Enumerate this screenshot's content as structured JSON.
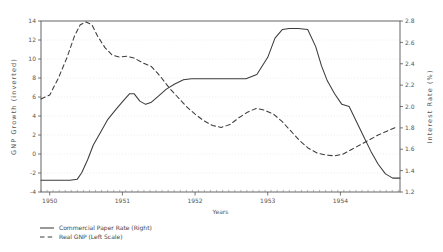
{
  "chart_data": {
    "type": "line",
    "title": "",
    "xlabel": "Years",
    "ylabel": "GNP Growth (inverted)",
    "y2label": "Interest Rate (%)",
    "xlim": [
      1949.88,
      1954.82
    ],
    "xticks": [
      1950,
      1951,
      1952,
      1953,
      1954
    ],
    "xticklabels": [
      "1950",
      "1951",
      "1952",
      "1953",
      "1954"
    ],
    "ylim": [
      14,
      -4
    ],
    "yticks": [
      -4,
      -2,
      0,
      2,
      4,
      6,
      8,
      10,
      12,
      14
    ],
    "yticklabels": [
      "-4",
      "-2",
      "0",
      "2",
      "4",
      "6",
      "8",
      "10",
      "12",
      "14"
    ],
    "y2lim": [
      1.2,
      2.8
    ],
    "y2ticks": [
      1.2,
      1.4,
      1.6,
      1.8,
      2.0,
      2.2,
      2.4,
      2.6,
      2.8
    ],
    "y2ticklabels": [
      "1.2",
      "1.4",
      "1.6",
      "1.8",
      "2.0",
      "2.2",
      "2.4",
      "2.6",
      "2.8"
    ],
    "grid": true,
    "grid_color": "#cccccc",
    "legend_position": "below-left",
    "line_color": "#3c3c3c",
    "series": [
      {
        "name": "Commercial Paper Rate (Right)",
        "axis": "right",
        "style": "solid",
        "x": [
          1949.88,
          1950.0,
          1950.15,
          1950.28,
          1950.38,
          1950.44,
          1950.52,
          1950.6,
          1950.7,
          1950.8,
          1950.92,
          1951.02,
          1951.1,
          1951.16,
          1951.24,
          1951.32,
          1951.4,
          1951.5,
          1951.6,
          1951.72,
          1951.84,
          1951.95,
          1952.05,
          1952.16,
          1952.28,
          1952.4,
          1952.55,
          1952.7,
          1952.85,
          1953.0,
          1953.1,
          1953.2,
          1953.3,
          1953.42,
          1953.55,
          1953.66,
          1953.74,
          1953.82,
          1953.92,
          1954.02,
          1954.12,
          1954.22,
          1954.32,
          1954.42,
          1954.52,
          1954.62,
          1954.72,
          1954.82
        ],
        "y": [
          1.31,
          1.31,
          1.31,
          1.31,
          1.32,
          1.38,
          1.5,
          1.64,
          1.76,
          1.88,
          1.98,
          2.06,
          2.12,
          2.12,
          2.05,
          2.02,
          2.04,
          2.1,
          2.16,
          2.21,
          2.25,
          2.26,
          2.26,
          2.26,
          2.26,
          2.26,
          2.26,
          2.26,
          2.3,
          2.46,
          2.64,
          2.72,
          2.73,
          2.73,
          2.72,
          2.56,
          2.38,
          2.24,
          2.12,
          2.02,
          2.0,
          1.86,
          1.72,
          1.58,
          1.46,
          1.37,
          1.33,
          1.33
        ]
      },
      {
        "name": "Real GNP (Left Scale)",
        "axis": "left",
        "style": "dashed",
        "x": [
          1949.88,
          1950.0,
          1950.12,
          1950.24,
          1950.34,
          1950.42,
          1950.5,
          1950.58,
          1950.66,
          1950.76,
          1950.86,
          1950.96,
          1951.06,
          1951.16,
          1951.28,
          1951.4,
          1951.52,
          1951.64,
          1951.76,
          1951.88,
          1952.0,
          1952.12,
          1952.24,
          1952.36,
          1952.48,
          1952.6,
          1952.72,
          1952.84,
          1952.96,
          1953.08,
          1953.2,
          1953.32,
          1953.44,
          1953.56,
          1953.68,
          1953.8,
          1953.92,
          1954.04,
          1954.16,
          1954.28,
          1954.4,
          1954.52,
          1954.64,
          1954.76
        ],
        "y": [
          5.8,
          6.2,
          8.0,
          10.2,
          12.4,
          13.6,
          13.9,
          13.6,
          12.4,
          11.2,
          10.4,
          10.2,
          10.3,
          10.1,
          9.6,
          9.2,
          8.2,
          7.0,
          6.0,
          5.0,
          4.2,
          3.5,
          3.0,
          2.8,
          3.1,
          3.8,
          4.4,
          4.8,
          4.6,
          4.2,
          3.4,
          2.4,
          1.4,
          0.6,
          0.1,
          -0.1,
          -0.2,
          0.0,
          0.5,
          1.0,
          1.5,
          2.0,
          2.4,
          2.8
        ]
      }
    ]
  },
  "legend": {
    "items": [
      {
        "label": "Commercial Paper Rate (Right)",
        "style": "solid"
      },
      {
        "label": "Real GNP (Left Scale)",
        "style": "dashed"
      }
    ]
  }
}
